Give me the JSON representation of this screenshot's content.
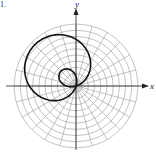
{
  "figure": {
    "number_label": "1.",
    "x_axis_label": "x",
    "y_axis_label": "y",
    "colors": {
      "grid": "#9a9a9a",
      "axis": "#222222",
      "curve": "#111111",
      "background": "#ffffff"
    },
    "grid": {
      "type": "polar",
      "center_px": [
        76,
        86
      ],
      "outer_radius_px": 62,
      "rings": 10,
      "radial_lines": 24,
      "radial_step_deg": 15
    }
  },
  "chart_data": {
    "type": "polar-curve",
    "title": "",
    "equation_form": "r = a + b*cos(theta - phi)",
    "parameters": {
      "a": 0.3,
      "b": 0.64,
      "phi_deg": 135
    },
    "r_max_rings": 10,
    "grid_on": true,
    "xlabel": "x",
    "ylabel": "y"
  }
}
